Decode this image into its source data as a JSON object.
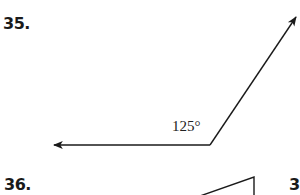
{
  "problems": [
    {
      "number": "35.",
      "figure": {
        "type": "angle",
        "angle_label": "125°",
        "vertex": [
          210,
          145
        ],
        "ray1_tip": [
          53,
          145
        ],
        "ray2_tip": [
          297,
          16
        ]
      }
    },
    {
      "number": "36.",
      "figure": {
        "type": "triangle-partial"
      }
    },
    {
      "number": "3"
    }
  ],
  "colors": {
    "ink": "#1a1a1a",
    "background": "#ffffff"
  }
}
